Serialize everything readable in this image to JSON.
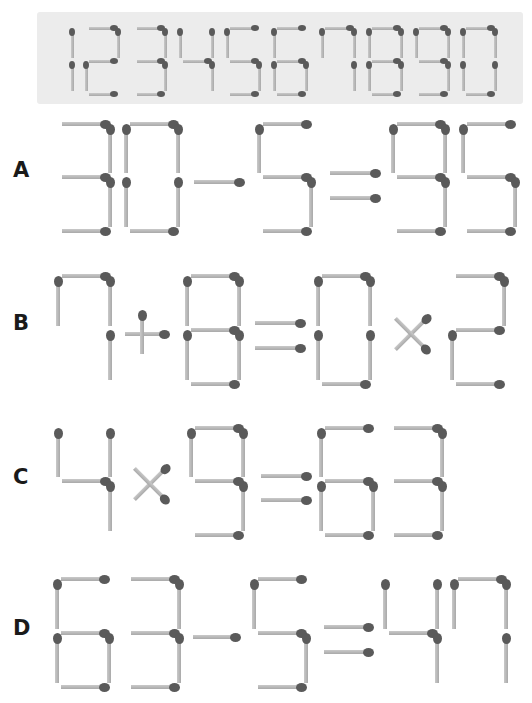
{
  "colors": {
    "banner_bg": "#ececec",
    "stick": "#b8b8b8",
    "head": "#5a5a5a",
    "label": "#1a1a1a"
  },
  "banner": {
    "x": 37,
    "y": 12,
    "w": 486,
    "h": 92,
    "digits_text": "1234567890",
    "top_y": 28,
    "mid_y": 61,
    "bot_y": 94,
    "seg_len": 28,
    "thick": 3,
    "head_w": 6,
    "head_h": 8,
    "glyphs": [
      {
        "char": "1",
        "x": 72,
        "w": 0
      },
      {
        "char": "2",
        "x": 86,
        "w": 32
      },
      {
        "char": "3",
        "x": 134,
        "w": 31
      },
      {
        "char": "4",
        "x": 180,
        "w": 32
      },
      {
        "char": "5",
        "x": 227,
        "w": 32
      },
      {
        "char": "6",
        "x": 274,
        "w": 32
      },
      {
        "char": "7",
        "x": 322,
        "w": 32
      },
      {
        "char": "8",
        "x": 369,
        "w": 32
      },
      {
        "char": "9",
        "x": 416,
        "w": 32
      },
      {
        "char": "0",
        "x": 463,
        "w": 32
      }
    ]
  },
  "puzzles": [
    {
      "label": "A",
      "equation": "30-5=95",
      "label_x": 13,
      "label_y": 160,
      "top_y": 124,
      "mid_y": 177,
      "bot_y": 231,
      "glyphs": [
        {
          "char": "3",
          "x": 58
        },
        {
          "char": "0",
          "x": 126
        },
        {
          "char": "-",
          "x": 194,
          "w": 46,
          "y": 182
        },
        {
          "char": "5",
          "x": 259
        },
        {
          "char": "=",
          "x": 330,
          "w": 46,
          "y1": 173,
          "y2": 198
        },
        {
          "char": "9",
          "x": 393
        },
        {
          "char": "5",
          "x": 463
        }
      ]
    },
    {
      "label": "B",
      "equation": "7+8=0×2",
      "label_x": 13,
      "label_y": 313,
      "top_y": 276,
      "mid_y": 330,
      "bot_y": 384,
      "glyphs": [
        {
          "char": "7",
          "x": 58
        },
        {
          "char": "+",
          "cx": 145,
          "cy": 334,
          "len": 44
        },
        {
          "char": "8",
          "x": 187
        },
        {
          "char": "=",
          "x": 255,
          "w": 46,
          "y1": 323,
          "y2": 348
        },
        {
          "char": "0",
          "x": 318
        },
        {
          "char": "×",
          "cx": 411,
          "cy": 334,
          "len": 44
        },
        {
          "char": "2",
          "x": 452
        }
      ]
    },
    {
      "label": "C",
      "equation": "4×9=63",
      "label_x": 13,
      "label_y": 467,
      "top_y": 428,
      "mid_y": 481,
      "bot_y": 535,
      "glyphs": [
        {
          "char": "4",
          "x": 58
        },
        {
          "char": "×",
          "cx": 150,
          "cy": 484,
          "len": 44
        },
        {
          "char": "9",
          "x": 191
        },
        {
          "char": "=",
          "x": 261,
          "w": 46,
          "y1": 476,
          "y2": 500
        },
        {
          "char": "6",
          "x": 321
        },
        {
          "char": "3",
          "x": 390
        }
      ]
    },
    {
      "label": "D",
      "equation": "63-5=47",
      "label_x": 13,
      "label_y": 618,
      "top_y": 579,
      "mid_y": 633,
      "bot_y": 687,
      "glyphs": [
        {
          "char": "6",
          "x": 57
        },
        {
          "char": "3",
          "x": 127
        },
        {
          "char": "-",
          "x": 193,
          "w": 43,
          "y": 637
        },
        {
          "char": "5",
          "x": 254
        },
        {
          "char": "=",
          "x": 324,
          "w": 45,
          "y1": 627,
          "y2": 652
        },
        {
          "char": "4",
          "x": 385
        },
        {
          "char": "7",
          "x": 454
        }
      ]
    }
  ],
  "digit_size": {
    "w": 52,
    "seg_len": 44,
    "thick": 4,
    "head_w": 9,
    "head_h": 11
  },
  "segments": {
    "0": [
      "a",
      "b",
      "c",
      "d",
      "e",
      "f"
    ],
    "1": [
      "f",
      "e"
    ],
    "2": [
      "a",
      "b",
      "g",
      "e",
      "d"
    ],
    "3": [
      "a",
      "b",
      "g",
      "c",
      "d"
    ],
    "4": [
      "f",
      "g",
      "b",
      "c"
    ],
    "5": [
      "a",
      "f",
      "g",
      "c",
      "d"
    ],
    "6": [
      "a",
      "f",
      "g",
      "e",
      "c",
      "d"
    ],
    "7": [
      "f",
      "a",
      "b",
      "c"
    ],
    "8": [
      "a",
      "b",
      "c",
      "d",
      "e",
      "f",
      "g"
    ],
    "9": [
      "a",
      "b",
      "c",
      "d",
      "f",
      "g"
    ]
  }
}
